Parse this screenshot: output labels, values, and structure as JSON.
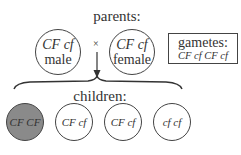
{
  "parents": {
    "title": "parents:",
    "cross_symbol": "×",
    "male": {
      "genotype": "CF cf",
      "sex": "male"
    },
    "female": {
      "genotype": "CF cf",
      "sex": "female"
    }
  },
  "gametes": {
    "title": "gametes:",
    "values": "CF cf CF cf"
  },
  "children": {
    "title": "children:",
    "items": [
      {
        "genotype": "CF CF",
        "affected": true
      },
      {
        "genotype": "CF cf",
        "affected": false
      },
      {
        "genotype": "CF cf",
        "affected": false
      },
      {
        "genotype": "cf cf",
        "affected": false
      }
    ]
  },
  "colors": {
    "affected_fill": "#8a8a8a",
    "stroke": "#444444",
    "background": "#ffffff"
  }
}
